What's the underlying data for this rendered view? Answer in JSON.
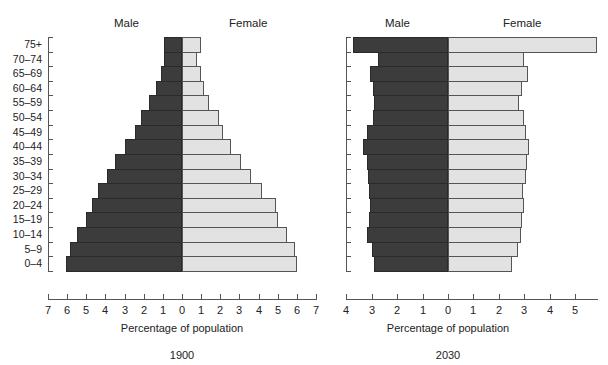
{
  "chart_data": [
    {
      "type": "bar",
      "subtype": "population-pyramid",
      "title": "1900",
      "xlabel": "Percentage of population",
      "ylabel": "",
      "categories": [
        "0–4",
        "5–9",
        "10–14",
        "15–19",
        "20–24",
        "25–29",
        "30–34",
        "35–39",
        "40–44",
        "45–49",
        "50–54",
        "55–59",
        "60–64",
        "65–69",
        "70–74",
        "75+"
      ],
      "series": [
        {
          "name": "Male",
          "color": "#3c3c3c",
          "values": [
            6.05,
            5.85,
            5.5,
            5.0,
            4.7,
            4.4,
            3.9,
            3.5,
            3.0,
            2.45,
            2.15,
            1.7,
            1.35,
            1.1,
            0.95,
            0.94
          ]
        },
        {
          "name": "Female",
          "color": "#e2e2e2",
          "values": [
            6.0,
            5.9,
            5.5,
            5.0,
            4.9,
            4.2,
            3.6,
            3.1,
            2.55,
            2.15,
            1.95,
            1.4,
            1.15,
            1.0,
            0.8,
            0.98
          ]
        }
      ],
      "xlim": [
        -7,
        7
      ],
      "xticks": [
        "7",
        "6",
        "5",
        "4",
        "3",
        "2",
        "1",
        "0",
        "1",
        "2",
        "3",
        "4",
        "5",
        "6",
        "7"
      ],
      "legend": {
        "left": "Male",
        "right": "Female",
        "position": "top"
      },
      "grid": false
    },
    {
      "type": "bar",
      "subtype": "population-pyramid",
      "title": "2030",
      "xlabel": "Percentage of population",
      "ylabel": "",
      "categories": [
        "0–4",
        "5–9",
        "10–14",
        "15–19",
        "20–24",
        "25–29",
        "30–34",
        "35–39",
        "40–44",
        "45–49",
        "50–54",
        "55–59",
        "60–64",
        "65–69",
        "70–74",
        "75+"
      ],
      "series": [
        {
          "name": "Male",
          "color": "#3c3c3c",
          "values": [
            2.9,
            3.0,
            3.2,
            3.1,
            3.05,
            3.1,
            3.15,
            3.2,
            3.35,
            3.2,
            2.95,
            2.9,
            2.95,
            3.05,
            2.75,
            3.75
          ]
        },
        {
          "name": "Female",
          "color": "#e2e2e2",
          "values": [
            2.5,
            2.75,
            2.85,
            2.9,
            3.0,
            2.95,
            3.05,
            3.1,
            3.2,
            3.05,
            3.0,
            2.8,
            2.9,
            3.15,
            3.0,
            5.85
          ]
        }
      ],
      "xlim": [
        -4,
        5.9
      ],
      "xticks": [
        "4",
        "3",
        "2",
        "1",
        "0",
        "1",
        "2",
        "3",
        "4",
        "5"
      ],
      "legend": {
        "left": "Male",
        "right": "Female",
        "position": "top"
      },
      "grid": false
    }
  ],
  "labels": {
    "male": "Male",
    "female": "Female",
    "xlabel": "Percentage of population",
    "left_caption": "1900",
    "right_caption": "2030"
  }
}
